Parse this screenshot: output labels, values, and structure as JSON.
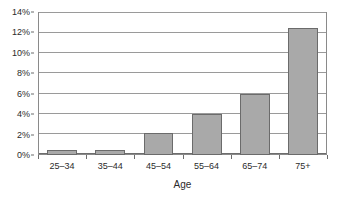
{
  "chart_data": {
    "type": "bar",
    "title": "",
    "xlabel": "Age",
    "ylabel": "",
    "categories": [
      "25–34",
      "35–44",
      "45–54",
      "55–64",
      "65–74",
      "75+"
    ],
    "values": [
      0.5,
      0.5,
      2.2,
      4.0,
      6.0,
      12.4
    ],
    "value_labels": [
      "0.5%",
      "0.5%",
      "2.2%",
      "4.0%",
      "6.0%",
      "12.4%"
    ],
    "ylim": [
      0,
      14
    ],
    "y_ticks": [
      0,
      2,
      4,
      6,
      8,
      10,
      12,
      14
    ],
    "y_tick_labels": [
      "0%",
      "2%",
      "4%",
      "6%",
      "8%",
      "10%",
      "12%",
      "14%"
    ],
    "grid": true,
    "legend": false,
    "legend_position": "none",
    "bar_color": "#a9a9a9",
    "bar_border_color": "#6b6b6b",
    "gridline_color": "#9a9a9a",
    "axis_color": "#6d6d6d",
    "text_color": "#2b2b2b",
    "background": "#ffffff"
  }
}
